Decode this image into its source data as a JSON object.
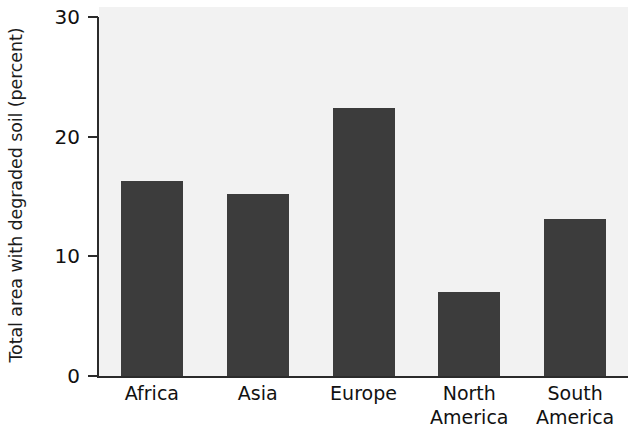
{
  "chart_data": {
    "type": "bar",
    "title": "",
    "xlabel": "",
    "ylabel": "Total area with degraded soil (percent)",
    "categories": [
      "Africa",
      "Asia",
      "Europe",
      "North America",
      "South America"
    ],
    "category_lines": [
      [
        "Africa"
      ],
      [
        "Asia"
      ],
      [
        "Europe"
      ],
      [
        "North",
        "America"
      ],
      [
        "South",
        "America"
      ]
    ],
    "values": [
      16.3,
      15.2,
      22.4,
      7.0,
      13.1
    ],
    "ylim": [
      0,
      30
    ],
    "yticks": [
      0,
      10,
      20,
      30
    ],
    "ytick_labels": [
      "0",
      "10",
      "20",
      "30"
    ],
    "grid": false,
    "legend": null,
    "bar_color": "#3c3c3c",
    "plot_background": "#f2f2f2",
    "axis_color": "#2b2b2b"
  },
  "axis": {
    "y_title": "Total area with degraded soil (percent)"
  }
}
